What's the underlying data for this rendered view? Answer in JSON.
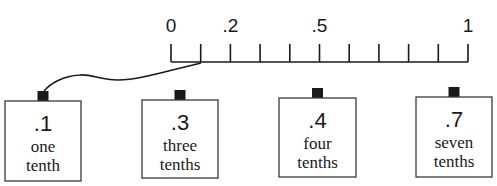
{
  "number_line": {
    "x_start": 171,
    "x_end": 468,
    "baseline_y": 62,
    "tick_top_y": 44,
    "tick_count": 11,
    "labels": [
      {
        "text": "0",
        "tick_index": 0
      },
      {
        "text": ".2",
        "tick_index": 2
      },
      {
        "text": ".5",
        "tick_index": 5
      },
      {
        "text": "1",
        "tick_index": 10
      }
    ]
  },
  "connector": {
    "from_tick_index": 1,
    "to_box_index": 0
  },
  "boxes": [
    {
      "decimal": ".1",
      "line1": "one",
      "line2": "tenth",
      "x": 5,
      "y": 101,
      "w": 76,
      "h": 80
    },
    {
      "decimal": ".3",
      "line1": "three",
      "line2": "tenths",
      "x": 142,
      "y": 100,
      "w": 76,
      "h": 78
    },
    {
      "decimal": ".4",
      "line1": "four",
      "line2": "tenths",
      "x": 279,
      "y": 98,
      "w": 77,
      "h": 79
    },
    {
      "decimal": ".7",
      "line1": "seven",
      "line2": "tenths",
      "x": 416,
      "y": 97,
      "w": 76,
      "h": 80
    }
  ],
  "colors": {
    "ink": "#1a1a1a",
    "box_border": "#3a3a3a",
    "background": "#ffffff"
  }
}
